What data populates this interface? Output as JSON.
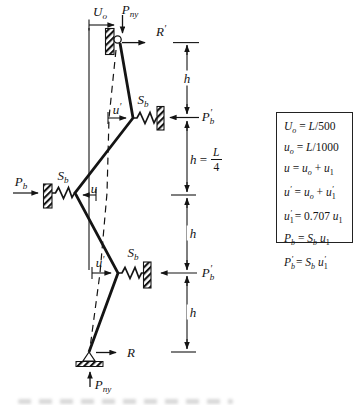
{
  "figure": {
    "type": "structural-bracing-diagram",
    "ink_color": "#141414",
    "background": "#ffffff"
  },
  "labels": {
    "initial_sway_top": "U_{o}",
    "axial_load_top": "P_{ny}",
    "reaction_top": "R'",
    "brace_stiffness_upper": "S_{b}",
    "displacement_upper": "u'",
    "brace_force_upper": "P_{b}'",
    "brace_stiffness_mid": "S_{b}",
    "displacement_mid": "u",
    "brace_force_mid": "P_{b}",
    "brace_stiffness_lower": "S_{b}",
    "displacement_lower": "u'",
    "brace_force_lower": "P_{b}'",
    "reaction_base": "R",
    "axial_load_base": "P_{ny}"
  },
  "dimensions": {
    "segment1": "h",
    "segment2_prefix": "h =",
    "segment2_fraction_numerator": "L",
    "segment2_fraction_denominator": "4",
    "segment3": "h",
    "segment4": "h"
  },
  "equations": {
    "lines": [
      "U_{o} = L/500",
      "u_{o} = L/1000",
      "u = u_{o} + u_{1}",
      "u' = u_{o} + u_{1}'",
      "u_{1}' = 0.707 u_{1}",
      "P_{b} = S_{b} u_{1}",
      "P_{b}' = S_{b} u_{1}'"
    ]
  }
}
